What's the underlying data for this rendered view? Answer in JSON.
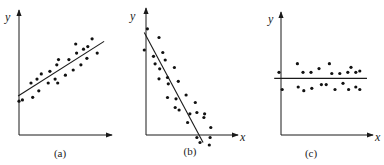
{
  "chart_data": [
    {
      "type": "scatter",
      "caption": "(a)",
      "xlabel": "",
      "ylabel": "y",
      "description": "positive linear correlation",
      "xlim": [
        0,
        100
      ],
      "ylim": [
        0,
        100
      ],
      "fit_line": {
        "x": [
          -8,
          92
        ],
        "y": [
          30,
          72
        ]
      },
      "points": {
        "x": [
          -7,
          -3,
          7,
          9,
          14,
          16,
          19,
          27,
          29,
          35,
          37,
          38,
          39,
          47,
          51,
          56,
          59,
          60,
          65,
          68,
          72,
          73,
          78,
          84
        ],
        "y": [
          26,
          27,
          40,
          29,
          43,
          34,
          47,
          40,
          49,
          43,
          54,
          40,
          58,
          46,
          58,
          50,
          70,
          63,
          54,
          66,
          59,
          68,
          74,
          63
        ]
      }
    },
    {
      "type": "scatter",
      "caption": "(b)",
      "xlabel": "x",
      "ylabel": "y",
      "description": "negative linear correlation",
      "xlim": [
        0,
        100
      ],
      "ylim": [
        0,
        100
      ],
      "fit_line": {
        "x": [
          -10,
          66
        ],
        "y": [
          82,
          -6
        ]
      },
      "points": {
        "x": [
          -6,
          -10,
          9,
          2,
          14,
          4,
          10,
          9,
          20,
          17,
          21,
          29,
          20,
          31,
          34,
          30,
          35,
          44,
          46,
          49,
          56,
          58,
          58,
          68,
          62,
          67,
          76,
          74,
          75
        ],
        "y": [
          85,
          68,
          78,
          63,
          66,
          57,
          53,
          45,
          46,
          60,
          41,
          54,
          30,
          29,
          43,
          22,
          20,
          32,
          10,
          17,
          26,
          18,
          -2,
          17,
          -6,
          14,
          6,
          -8,
          -2
        ]
      }
    },
    {
      "type": "scatter",
      "caption": "(c)",
      "xlabel": "x",
      "ylabel": "y",
      "description": "no correlation",
      "xlim": [
        0,
        100
      ],
      "ylim": [
        0,
        100
      ],
      "fit_line": {
        "x": [
          -16,
          100
        ],
        "y": [
          46,
          46
        ]
      },
      "points": {
        "x": [
          -10,
          -6,
          13,
          14,
          20,
          21,
          30,
          31,
          40,
          43,
          49,
          53,
          56,
          60,
          66,
          70,
          76,
          77,
          80,
          86,
          86,
          91,
          91
        ],
        "y": [
          51,
          37,
          58,
          39,
          51,
          36,
          51,
          38,
          54,
          41,
          41,
          58,
          50,
          37,
          50,
          42,
          51,
          37,
          55,
          51,
          39,
          52,
          37
        ]
      }
    }
  ]
}
